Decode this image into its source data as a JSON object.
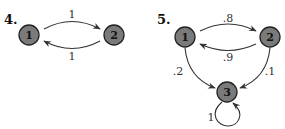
{
  "diagrams": [
    {
      "number_label": "4.",
      "nodes": [
        {
          "id": "1",
          "label": "1"
        },
        {
          "id": "2",
          "label": "2"
        }
      ],
      "edges": [
        {
          "from": "1",
          "to": "2",
          "label": "1"
        },
        {
          "from": "2",
          "to": "1",
          "label": "1"
        }
      ]
    },
    {
      "number_label": "5.",
      "nodes": [
        {
          "id": "1",
          "label": "1"
        },
        {
          "id": "2",
          "label": "2"
        },
        {
          "id": "3",
          "label": "3"
        }
      ],
      "edges": [
        {
          "from": "1",
          "to": "2",
          "label": ".8"
        },
        {
          "from": "2",
          "to": "1",
          "label": ".9"
        },
        {
          "from": "1",
          "to": "3",
          "label": ".2"
        },
        {
          "from": "2",
          "to": "3",
          "label": ".1"
        },
        {
          "from": "3",
          "to": "3",
          "label": "1"
        }
      ]
    }
  ],
  "colors": {
    "node_fill": "#7a7a7a",
    "stroke": "#333333"
  }
}
